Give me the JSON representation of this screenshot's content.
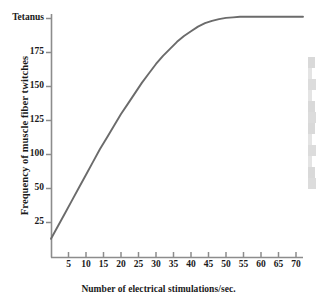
{
  "chart_data": {
    "type": "line",
    "title": "",
    "xlabel": "Number of electrical stimulations/sec.",
    "ylabel": "Frequency of muscle fiber twitches",
    "xlim": [
      0,
      73
    ],
    "ylim": [
      0,
      207
    ],
    "grid": false,
    "legend": null,
    "line_color": "#6b6b6b",
    "axis_color": "#8c8c8c",
    "x_ticks": [
      5,
      10,
      15,
      20,
      25,
      30,
      35,
      40,
      45,
      50,
      55,
      60,
      65,
      70
    ],
    "y_ticks": [
      {
        "value": 25,
        "label": "25"
      },
      {
        "value": 50,
        "label": "50"
      },
      {
        "value": 75,
        "label": ""
      },
      {
        "value": 100,
        "label": "100"
      },
      {
        "value": 125,
        "label": "125"
      },
      {
        "value": 150,
        "label": "150"
      },
      {
        "value": 175,
        "label": "175"
      },
      {
        "value": 200,
        "label": "Tetanus"
      }
    ],
    "series": [
      {
        "name": "Frequency of muscle fiber twitches",
        "x": [
          0,
          2,
          4,
          6,
          8,
          10,
          12,
          14,
          16,
          18,
          20,
          22,
          24,
          26,
          28,
          30,
          32,
          34,
          36,
          38,
          40,
          42,
          44,
          46,
          48,
          50,
          52,
          54,
          56,
          58,
          60,
          62,
          64,
          66,
          68,
          70,
          72
        ],
        "values": [
          11,
          22,
          33,
          44,
          55,
          66,
          77,
          88,
          98,
          108,
          118,
          127,
          136,
          145,
          153,
          161,
          168,
          174,
          180,
          185,
          189,
          193,
          196,
          198,
          199.5,
          200.5,
          201,
          201.5,
          201.5,
          201.5,
          201.5,
          201.5,
          201.5,
          201.5,
          201.5,
          201.5,
          201.5
        ]
      }
    ],
    "annotations": [
      {
        "text": "Tetanus",
        "axis": "y",
        "value": 200,
        "note": "top y-axis tick is labelled Tetanus instead of a number"
      }
    ]
  }
}
